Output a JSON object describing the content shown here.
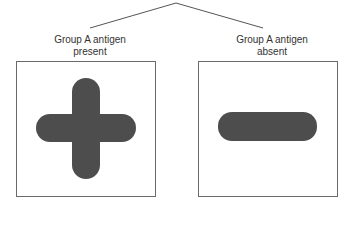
{
  "diagram": {
    "branches": [
      {
        "label_line1": "Group A antigen",
        "label_line2": "present",
        "symbol": "plus-icon"
      },
      {
        "label_line1": "Group A antigen",
        "label_line2": "absent",
        "symbol": "minus-icon"
      }
    ],
    "colors": {
      "line": "#555555",
      "box_border": "#6a6a6a",
      "symbol_fill": "#4d4d4d",
      "text": "#333333"
    }
  }
}
